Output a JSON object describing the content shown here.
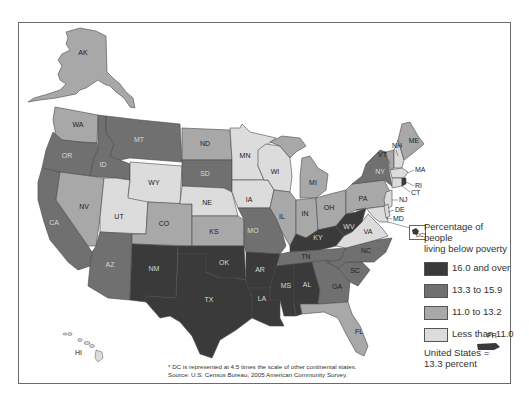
{
  "legend": {
    "title_line1": "Percentage of people",
    "title_line2": "living below poverty",
    "items": [
      {
        "label": "16.0 and over",
        "color": "#3a3a3a"
      },
      {
        "label": "13.3 to 15.9",
        "color": "#707070"
      },
      {
        "label": "11.0 to 13.2",
        "color": "#a8a8a8"
      },
      {
        "label": "Less than 11.0",
        "color": "#dcdcdc"
      }
    ],
    "note_line1": "United States =",
    "note_line2": "13.3 percent"
  },
  "footnote": {
    "line1": "* DC is represented at 4.5 times the scale of other continental states.",
    "line2": "Source: U.S. Census Bureau, 2005 American Community Survey."
  },
  "dc_inset_label": "DC*",
  "states": {
    "AK": "AK",
    "WA": "WA",
    "OR": "OR",
    "CA": "CA",
    "ID": "ID",
    "NV": "NV",
    "MT": "MT",
    "WY": "WY",
    "UT": "UT",
    "AZ": "AZ",
    "CO": "CO",
    "NM": "NM",
    "ND": "ND",
    "SD": "SD",
    "NE": "NE",
    "KS": "KS",
    "OK": "OK",
    "TX": "TX",
    "MN": "MN",
    "IA": "IA",
    "MO": "MO",
    "AR": "AR",
    "LA": "LA",
    "WI": "WI",
    "IL": "IL",
    "MI": "MI",
    "IN": "IN",
    "OH": "OH",
    "KY": "KY",
    "TN": "TN",
    "MS": "MS",
    "AL": "AL",
    "GA": "GA",
    "FL": "FL",
    "SC": "SC",
    "NC": "NC",
    "VA": "VA",
    "WV": "WV",
    "PA": "PA",
    "NY": "NY",
    "VT": "VT",
    "NH": "NH",
    "ME": "ME",
    "MA": "MA",
    "RI": "RI",
    "CT": "CT",
    "NJ": "NJ",
    "DE": "DE",
    "MD": "MD",
    "HI": "HI",
    "PR": "PR"
  },
  "state_categories": {
    "16.0 and over": [
      "NM",
      "TX",
      "OK",
      "AR",
      "LA",
      "MS",
      "AL",
      "KY",
      "WV",
      "DC"
    ],
    "13.3 to 15.9": [
      "OR",
      "CA",
      "ID",
      "MT",
      "AZ",
      "SD",
      "MO",
      "TN",
      "GA",
      "SC",
      "NC",
      "NY"
    ],
    "11.0 to 13.2": [
      "AK",
      "WA",
      "NV",
      "CO",
      "ND",
      "KS",
      "IL",
      "MI",
      "IN",
      "OH",
      "PA",
      "FL",
      "ME",
      "VT",
      "RI"
    ],
    "Less than 11.0": [
      "UT",
      "WY",
      "NE",
      "MN",
      "IA",
      "WI",
      "VA",
      "NH",
      "MA",
      "CT",
      "NJ",
      "DE",
      "MD",
      "HI"
    ]
  }
}
